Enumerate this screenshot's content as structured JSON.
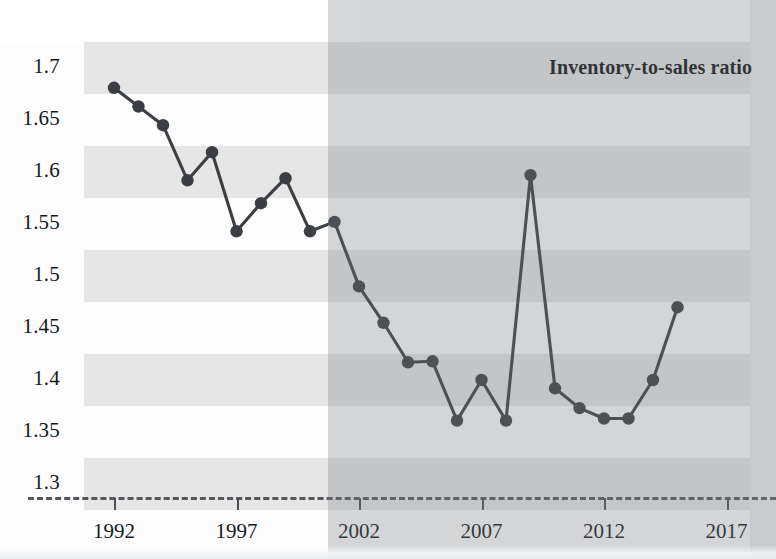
{
  "chart_data": {
    "type": "line",
    "title": "Inventory-to-sales ratio",
    "xlabel": "",
    "ylabel": "",
    "xlim": [
      1991,
      2017.5
    ],
    "ylim": [
      1.3,
      1.7
    ],
    "xticks": [
      "1992",
      "1997",
      "2002",
      "2007",
      "2012",
      "2017"
    ],
    "xtick_values": [
      1992,
      1997,
      2002,
      2007,
      2012,
      2017
    ],
    "yticks": [
      "1.7",
      "1.65",
      "1.6",
      "1.55",
      "1.5",
      "1.45",
      "1.4",
      "1.35",
      "1.3"
    ],
    "ytick_values": [
      1.7,
      1.65,
      1.6,
      1.55,
      1.5,
      1.45,
      1.4,
      1.35,
      1.3
    ],
    "grid": "horizontal-bands",
    "legend": "none",
    "marker": "circle",
    "line_color": "#3b3f44",
    "marker_color": "#3b3f44",
    "band_color": "#e6e6e6",
    "x": [
      1992,
      1993,
      1994,
      1995,
      1996,
      1997,
      1998,
      1999,
      2000,
      2001,
      2002,
      2003,
      2004,
      2005,
      2006,
      2007,
      2008,
      2009,
      2010,
      2011,
      2012,
      2013,
      2014,
      2015
    ],
    "values": [
      1.681,
      1.663,
      1.645,
      1.592,
      1.619,
      1.543,
      1.57,
      1.594,
      1.543,
      1.552,
      1.49,
      1.455,
      1.417,
      1.418,
      1.361,
      1.4,
      1.361,
      1.597,
      1.392,
      1.373,
      1.363,
      1.363,
      1.4,
      1.47
    ],
    "series": [
      {
        "name": "Inventory-to-sales ratio",
        "values": [
          1.681,
          1.663,
          1.645,
          1.592,
          1.619,
          1.543,
          1.57,
          1.594,
          1.543,
          1.552,
          1.49,
          1.455,
          1.417,
          1.418,
          1.361,
          1.4,
          1.361,
          1.597,
          1.392,
          1.373,
          1.363,
          1.363,
          1.4,
          1.47
        ]
      }
    ]
  },
  "chart": {
    "legend_label": "Inventory-to-sales ratio"
  }
}
